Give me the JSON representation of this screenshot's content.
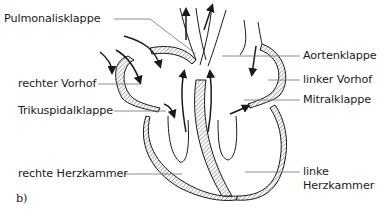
{
  "diagram": {
    "subfigure_label": "b)",
    "labels_left": [
      {
        "id": "pulmonalisklappe",
        "text": "Pulmonalisklappe"
      },
      {
        "id": "rechter-vorhof",
        "text": "rechter Vorhof"
      },
      {
        "id": "trikuspidalklappe",
        "text": "Trikuspidalklappe"
      },
      {
        "id": "rechte-herzkammer",
        "text": "rechte Herzkammer"
      }
    ],
    "labels_right": [
      {
        "id": "aortenklappe",
        "text": "Aortenklappe"
      },
      {
        "id": "linker-vorhof",
        "text": "linker Vorhof"
      },
      {
        "id": "mitralklappe",
        "text": "Mitralklappe"
      },
      {
        "id": "linke-herzkammer",
        "line1": "linke",
        "line2": "Herzkammer"
      }
    ],
    "colors": {
      "stroke": "#1a1a1a",
      "leader": "#6e6e6e",
      "hatch": "#555555",
      "background": "#ffffff"
    }
  }
}
